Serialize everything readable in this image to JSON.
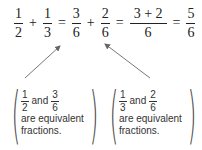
{
  "equation": {
    "terms": [
      {
        "num": "1",
        "den": "2"
      },
      {
        "op": "+"
      },
      {
        "num": "1",
        "den": "3"
      },
      {
        "op": "="
      },
      {
        "num": "3",
        "den": "6"
      },
      {
        "op": "+"
      },
      {
        "num": "2",
        "den": "6"
      },
      {
        "op": "="
      },
      {
        "num": "3 + 2",
        "den": "6"
      },
      {
        "op": "="
      },
      {
        "num": "5",
        "den": "6"
      }
    ]
  },
  "notes": [
    {
      "a_num": "1",
      "a_den": "2",
      "and": "and",
      "b_num": "3",
      "b_den": "6",
      "line2": "are equivalent",
      "line3": "fractions."
    },
    {
      "a_num": "1",
      "a_den": "3",
      "and": "and",
      "b_num": "2",
      "b_den": "6",
      "line2": "are equivalent",
      "line3": "fractions."
    }
  ]
}
